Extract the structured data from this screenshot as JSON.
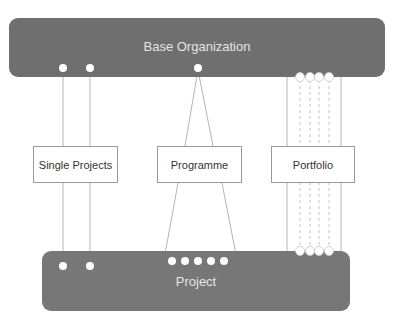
{
  "diagram": {
    "top_bar": {
      "label": "Base Organization",
      "color": "#6f6f6f"
    },
    "bottom_bar": {
      "label": "Project",
      "color": "#777777"
    },
    "boxes": [
      {
        "id": "single-projects",
        "label": "Single Projects"
      },
      {
        "id": "programme",
        "label": "Programme"
      },
      {
        "id": "portfolio",
        "label": "Portfolio"
      }
    ],
    "connections": [
      {
        "from": "Base Organization",
        "via": "Single Projects",
        "to": "Project",
        "count": 2,
        "style": "parallel solid lines"
      },
      {
        "from": "Base Organization",
        "via": "Programme",
        "to": "Project",
        "count": 5,
        "style": "fan-out (1 to 5)"
      },
      {
        "from": "Base Organization",
        "via": "Portfolio",
        "to": "Project",
        "count": 4,
        "style": "parallel dashed lines within solid bracket"
      }
    ],
    "colors": {
      "line": "#b5b5b5",
      "dot": "#ffffff",
      "box_border": "#9a9a9a"
    }
  }
}
